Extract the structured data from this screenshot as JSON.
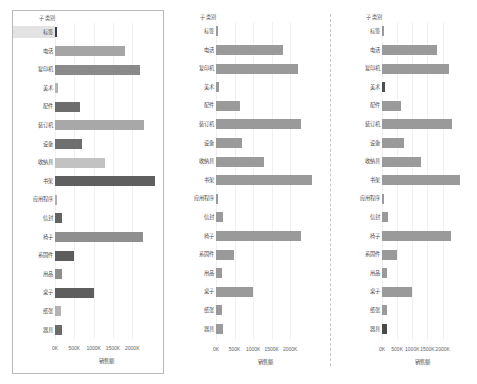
{
  "chart_data": [
    {
      "type": "bar",
      "orientation": "horizontal",
      "title": "",
      "xlabel": "销售额",
      "ylabel": "子类别",
      "header_label": "子类别",
      "categories": [
        "标签",
        "电话",
        "复印机",
        "美术",
        "配件",
        "装订机",
        "设备",
        "收纳具",
        "书架",
        "应用程序",
        "信封",
        "椅子",
        "系固件",
        "用品",
        "桌子",
        "纸张",
        "器具"
      ],
      "values": [
        35000,
        1810000,
        2200000,
        90000,
        640000,
        2300000,
        710000,
        1300000,
        2580000,
        55000,
        185000,
        2280000,
        480000,
        175000,
        1000000,
        160000,
        180000
      ],
      "xlim": [
        0,
        2640000
      ],
      "ticks": [
        0,
        500000,
        1000000,
        1500000,
        2000000
      ],
      "ticklabels": [
        "0K",
        "500K",
        "1000K",
        "1500K",
        "2000K"
      ],
      "grid": true,
      "legend": "none",
      "highlight_category": "标签",
      "bar_colors": [
        "#3d3d3d",
        "#a5a5a5",
        "#8a8a8a",
        "#b5b5b5",
        "#6d6d6d",
        "#a8a8a8",
        "#6f6f6f",
        "#c2c2c2",
        "#5f5f5f",
        "#b0b0b0",
        "#646464",
        "#8f8f8f",
        "#5d5d5d",
        "#8d8d8d",
        "#5e5e5e",
        "#b3b3b3",
        "#6b6b6b"
      ]
    },
    {
      "type": "bar",
      "orientation": "horizontal",
      "title": "",
      "xlabel": "销售额",
      "ylabel": "子类别",
      "header_label": "子类别",
      "categories": [
        "标签",
        "电话",
        "复印机",
        "美术",
        "配件",
        "装订机",
        "设备",
        "收纳具",
        "书架",
        "应用程序",
        "信封",
        "椅子",
        "系固件",
        "用品",
        "桌子",
        "纸张",
        "器具"
      ],
      "values": [
        35000,
        1810000,
        2200000,
        90000,
        640000,
        2300000,
        710000,
        1300000,
        2580000,
        55000,
        185000,
        2280000,
        480000,
        175000,
        1000000,
        160000,
        180000
      ],
      "xlim": [
        0,
        2640000
      ],
      "ticks": [
        0,
        500000,
        1000000,
        1500000,
        2000000
      ],
      "ticklabels": [
        "0K",
        "500K",
        "1000K",
        "1500K",
        "2000K"
      ],
      "grid": true,
      "legend": "none",
      "highlight_category": "",
      "bar_colors": [
        "#9a9a9a",
        "#9a9a9a",
        "#9a9a9a",
        "#9a9a9a",
        "#9a9a9a",
        "#9a9a9a",
        "#9a9a9a",
        "#9a9a9a",
        "#9a9a9a",
        "#9a9a9a",
        "#9a9a9a",
        "#9a9a9a",
        "#9a9a9a",
        "#9a9a9a",
        "#9a9a9a",
        "#9a9a9a",
        "#9a9a9a"
      ]
    },
    {
      "type": "bar",
      "orientation": "horizontal",
      "title": "",
      "xlabel": "销售额",
      "ylabel": "子类别",
      "header_label": "子类别",
      "categories": [
        "标签",
        "电话",
        "复印机",
        "美术",
        "配件",
        "装订机",
        "设备",
        "收纳具",
        "书架",
        "应用程序",
        "信封",
        "椅子",
        "系固件",
        "用品",
        "桌子",
        "纸张",
        "器具"
      ],
      "values": [
        35000,
        1810000,
        2200000,
        90000,
        640000,
        2300000,
        710000,
        1300000,
        2580000,
        55000,
        185000,
        2280000,
        480000,
        175000,
        1000000,
        160000,
        180000
      ],
      "xlim": [
        0,
        2640000
      ],
      "ticks": [
        0,
        500000,
        1000000,
        1500000,
        2000000
      ],
      "ticklabels": [
        "0K",
        "500K",
        "1000K",
        "1500K",
        "2000K"
      ],
      "grid": true,
      "legend": "none",
      "highlight_category": "",
      "bar_colors": [
        "#9a9a9a",
        "#9a9a9a",
        "#9a9a9a",
        "#4f4f4f",
        "#9a9a9a",
        "#9a9a9a",
        "#9a9a9a",
        "#9a9a9a",
        "#9a9a9a",
        "#9a9a9a",
        "#9a9a9a",
        "#9a9a9a",
        "#9a9a9a",
        "#9a9a9a",
        "#9a9a9a",
        "#9a9a9a",
        "#4a4a4a"
      ]
    }
  ],
  "layout": {
    "panel_count": 3,
    "separator_count": 1,
    "label_width_px": 42
  }
}
